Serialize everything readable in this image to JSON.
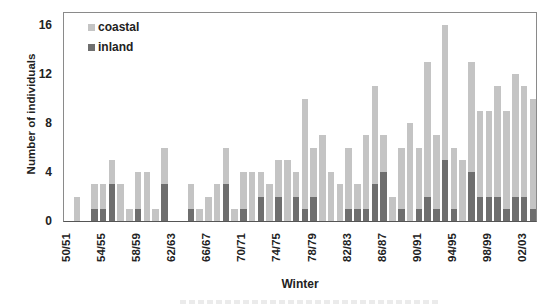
{
  "chart_data": {
    "type": "bar",
    "stacked": true,
    "title": "",
    "xlabel": "Winter",
    "ylabel": "Number of individuals",
    "ylim": [
      0,
      17
    ],
    "yticks": [
      0,
      4,
      8,
      12,
      16
    ],
    "grid": false,
    "legend_position": "top-left inside",
    "colors": {
      "coastal": "#c4c4c4",
      "inland": "#6e6e6e"
    },
    "categories": [
      "50/51",
      "51/52",
      "52/53",
      "53/54",
      "54/55",
      "55/56",
      "56/57",
      "57/58",
      "58/59",
      "59/60",
      "60/61",
      "61/62",
      "62/63",
      "63/64",
      "64/65",
      "65/66",
      "66/67",
      "67/68",
      "68/69",
      "69/70",
      "70/71",
      "71/72",
      "72/73",
      "73/74",
      "74/75",
      "75/76",
      "76/77",
      "77/78",
      "78/79",
      "79/80",
      "80/81",
      "81/82",
      "82/83",
      "83/84",
      "84/85",
      "85/86",
      "86/87",
      "87/88",
      "88/89",
      "89/90",
      "90/91",
      "91/92",
      "92/93",
      "93/94",
      "94/95",
      "95/96",
      "96/97",
      "97/98",
      "98/99",
      "99/00",
      "00/01",
      "01/02",
      "02/03",
      "03/04"
    ],
    "tick_labels": [
      "50/51",
      "54/55",
      "58/59",
      "62/63",
      "66/67",
      "70/71",
      "74/75",
      "78/79",
      "82/83",
      "86/87",
      "90/91",
      "94/95",
      "98/99",
      "02/03"
    ],
    "series": [
      {
        "name": "inland",
        "values": [
          0,
          0,
          0,
          1,
          1,
          3,
          0,
          0,
          1,
          0,
          0,
          3,
          0,
          0,
          1,
          0,
          0,
          0,
          3,
          0,
          1,
          0,
          2,
          0,
          2,
          0,
          2,
          1,
          2,
          0,
          0,
          0,
          1,
          1,
          1,
          3,
          4,
          0,
          1,
          0,
          1,
          2,
          1,
          5,
          1,
          0,
          4,
          2,
          2,
          2,
          1,
          2,
          2,
          1
        ]
      },
      {
        "name": "coastal",
        "values": [
          0,
          2,
          0,
          2,
          2,
          2,
          3,
          1,
          3,
          4,
          1,
          3,
          0,
          0,
          2,
          1,
          2,
          3,
          3,
          1,
          3,
          4,
          2,
          3,
          3,
          5,
          2,
          9,
          4,
          7,
          4,
          3,
          5,
          2,
          6,
          8,
          3,
          2,
          5,
          8,
          5,
          11,
          6,
          11,
          5,
          5,
          9,
          7,
          7,
          9,
          8,
          10,
          9,
          9
        ]
      }
    ],
    "totals": [
      0,
      2,
      0,
      3,
      3,
      5,
      3,
      1,
      4,
      4,
      1,
      6,
      0,
      0,
      3,
      1,
      2,
      3,
      6,
      1,
      4,
      4,
      4,
      3,
      5,
      5,
      4,
      10,
      6,
      7,
      4,
      3,
      6,
      3,
      7,
      11,
      7,
      2,
      6,
      8,
      6,
      13,
      7,
      16,
      6,
      5,
      13,
      9,
      9,
      11,
      9,
      12,
      11,
      10
    ]
  },
  "legend": {
    "items": [
      {
        "label": "coastal"
      },
      {
        "label": "inland"
      }
    ]
  }
}
